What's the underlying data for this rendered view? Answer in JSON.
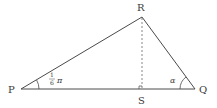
{
  "diagram": {
    "type": "triangle",
    "title": "",
    "vertices": {
      "P": {
        "label": "P",
        "x": 21,
        "y": 89
      },
      "Q": {
        "label": "Q",
        "x": 195,
        "y": 89
      },
      "R": {
        "label": "R",
        "x": 142,
        "y": 17
      },
      "S": {
        "label": "S",
        "x": 142,
        "y": 89
      }
    },
    "angles": {
      "P": {
        "numerator": "1",
        "denominator": "6",
        "symbol": "π"
      },
      "Q": {
        "symbol": "α"
      }
    },
    "segments": [
      {
        "from": "P",
        "to": "R",
        "style": "solid"
      },
      {
        "from": "R",
        "to": "Q",
        "style": "solid"
      },
      {
        "from": "P",
        "to": "Q",
        "style": "solid"
      },
      {
        "from": "R",
        "to": "S",
        "style": "dashed"
      }
    ],
    "right_angle_at": "S",
    "colors": {
      "line": "#4a4a4a",
      "text": "#3a3a3a",
      "background": "#ffffff"
    }
  }
}
